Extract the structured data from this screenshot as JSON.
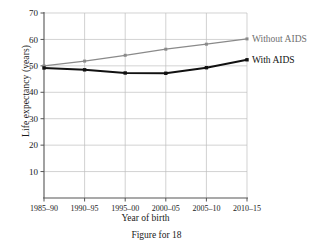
{
  "figure": {
    "caption": "Figure for 18"
  },
  "chart_data": {
    "type": "line",
    "title": "",
    "xlabel": "Year of birth",
    "ylabel": "Life expectancy (years)",
    "categories": [
      "1985–90",
      "1990–95",
      "1995–00",
      "2000–05",
      "2005–10",
      "2010–15"
    ],
    "ylim": [
      0,
      70
    ],
    "yticks": [
      10,
      20,
      30,
      40,
      50,
      60,
      70
    ],
    "ytick_labels": [
      "10",
      "20",
      "30",
      "40",
      "50",
      "60",
      "70"
    ],
    "grid": true,
    "legend_position": "right-of-plot-inline",
    "series": [
      {
        "name": "Without AIDS",
        "color": "#8a8a8a",
        "marker": "square",
        "values": [
          50.0,
          51.8,
          54.0,
          56.3,
          58.2,
          60.2
        ]
      },
      {
        "name": "With AIDS",
        "color": "#111111",
        "marker": "square",
        "values": [
          49.2,
          48.5,
          47.3,
          47.2,
          49.3,
          52.3
        ]
      }
    ]
  }
}
